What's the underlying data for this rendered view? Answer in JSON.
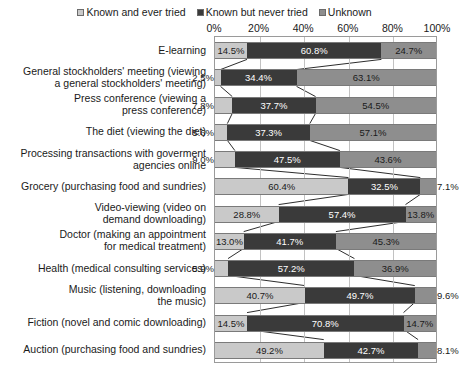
{
  "legend": {
    "items": [
      {
        "label": "Known and ever tried",
        "color": "#c9c9c9"
      },
      {
        "label": "Known but never tried",
        "color": "#3a3a3a"
      },
      {
        "label": "Unknown",
        "color": "#8e8e8e"
      }
    ]
  },
  "chart_data": {
    "type": "bar",
    "subtype": "horizontal-100-percent-stacked",
    "title": "",
    "xlabel": "",
    "ylabel": "",
    "xlim": [
      0,
      100
    ],
    "xticks": [
      "0%",
      "20%",
      "40%",
      "60%",
      "80%",
      "100%"
    ],
    "xtick_values": [
      0,
      20,
      40,
      60,
      80,
      100
    ],
    "grid": true,
    "legend_position": "top-center",
    "series": [
      {
        "name": "Known and ever tried",
        "color": "#c9c9c9",
        "values": [
          14.5,
          2.5,
          7.8,
          5.6,
          9.0,
          60.4,
          28.8,
          13.0,
          5.9,
          40.7,
          14.5,
          49.2
        ]
      },
      {
        "name": "Known but never tried",
        "color": "#3a3a3a",
        "values": [
          60.8,
          34.4,
          37.7,
          37.3,
          47.5,
          32.5,
          57.4,
          41.7,
          57.2,
          49.7,
          70.8,
          42.7
        ]
      },
      {
        "name": "Unknown",
        "color": "#8e8e8e",
        "values": [
          24.7,
          63.1,
          54.5,
          57.1,
          43.6,
          7.1,
          13.8,
          45.3,
          36.9,
          9.6,
          14.7,
          8.1
        ]
      }
    ],
    "categories": [
      "E-learning",
      "General stockholders' meeting (viewing a general stockholders' meeting)",
      "Press conference (viewing a press conference)",
      "The diet (viewing the diet)",
      "Processing transactions with goverment agencies online",
      "Grocery (purchasing food and sundries)",
      "Video-viewing (video on demand downloading)",
      "Doctor (making an appointment for medical treatment)",
      "Health (medical consulting services)",
      "Music (listening, downloading the music)",
      "Fiction (novel and comic downloading)",
      "Auction (purchasing food and sundries)"
    ],
    "category_lines": [
      [
        "E-learning"
      ],
      [
        "General stockholders' meeting (viewing",
        "a general stockholders' meeting)"
      ],
      [
        "Press conference (viewing a",
        "press conference)"
      ],
      [
        "The diet (viewing the diet)"
      ],
      [
        "Processing transactions with goverment",
        "agencies online"
      ],
      [
        "Grocery (purchasing food and sundries)"
      ],
      [
        "Video-viewing (video on",
        "demand downloading)"
      ],
      [
        "Doctor (making an appointment",
        "for medical treatment)"
      ],
      [
        "Health (medical consulting services)"
      ],
      [
        "Music (listening, downloading",
        "the music)"
      ],
      [
        "Fiction (novel and comic downloading)"
      ],
      [
        "Auction (purchasing food and sundries)"
      ]
    ],
    "data_labels": [
      [
        "14.5%",
        "60.8%",
        "24.7%"
      ],
      [
        "2.5%",
        "34.4%",
        "63.1%"
      ],
      [
        "7.8%",
        "37.7%",
        "54.5%"
      ],
      [
        "5.6%",
        "37.3%",
        "57.1%"
      ],
      [
        "9.0%",
        "47.5%",
        "43.6%"
      ],
      [
        "60.4%",
        "32.5%",
        "7.1%"
      ],
      [
        "28.8%",
        "57.4%",
        "13.8%"
      ],
      [
        "13.0%",
        "41.7%",
        "45.3%"
      ],
      [
        "5.9%",
        "57.2%",
        "36.9%"
      ],
      [
        "40.7%",
        "49.7%",
        "9.6%"
      ],
      [
        "14.5%",
        "70.8%",
        "14.7%"
      ],
      [
        "49.2%",
        "42.7%",
        "8.1%"
      ]
    ]
  }
}
